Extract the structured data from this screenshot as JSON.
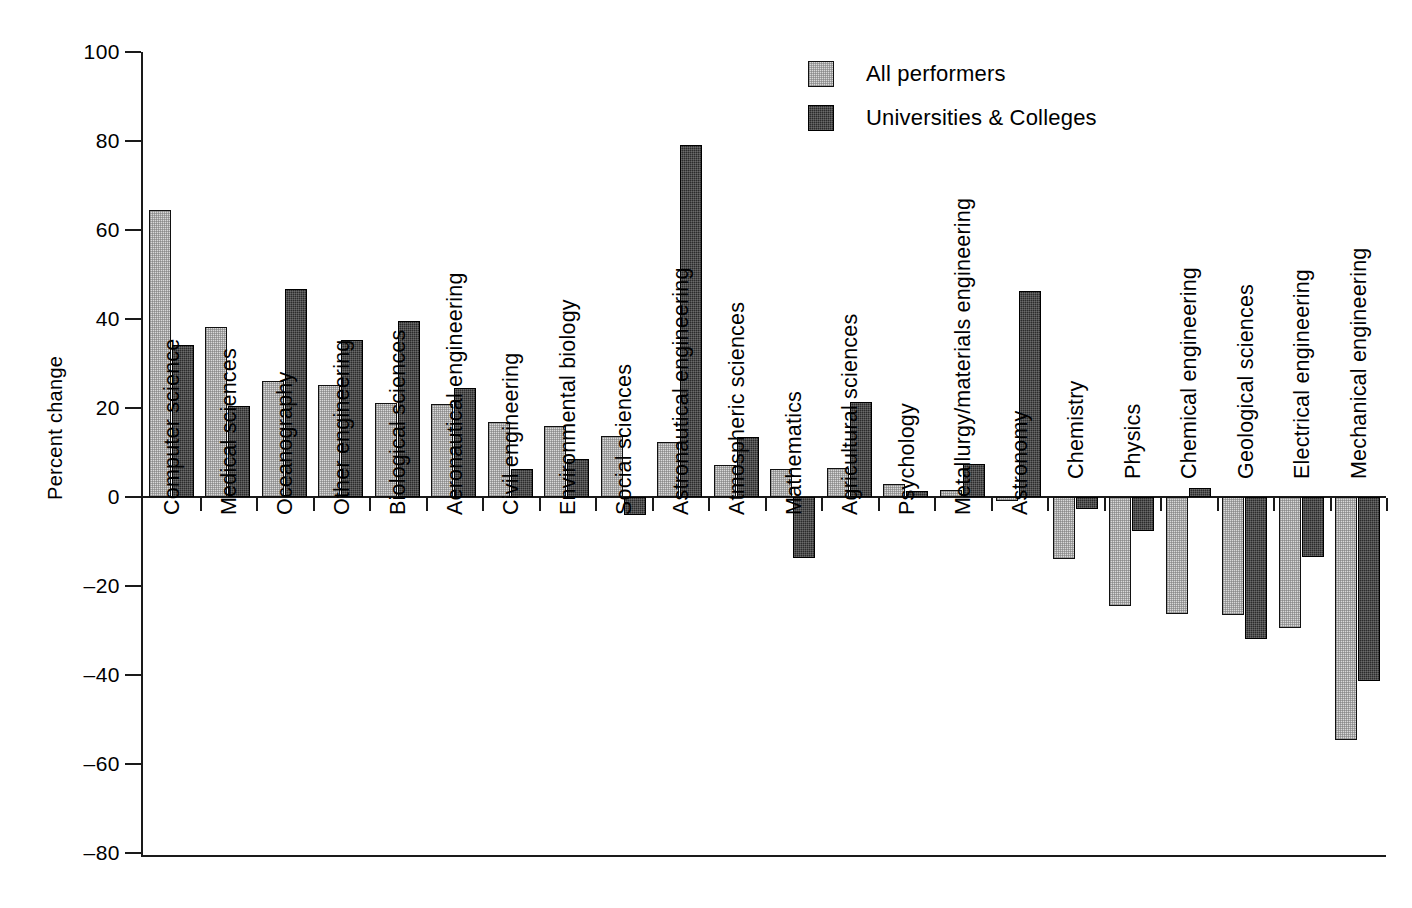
{
  "chart_data": {
    "type": "bar",
    "title": "",
    "xlabel": "",
    "ylabel": "Percent change",
    "ylim": [
      -80,
      100
    ],
    "yticks": [
      100,
      80,
      60,
      40,
      20,
      0,
      -20,
      -40,
      -60,
      -80
    ],
    "ytick_labels": [
      "100",
      "80",
      "60",
      "40",
      "20",
      "0",
      "–20",
      "–40",
      "–60",
      "–80"
    ],
    "grid": false,
    "legend_position": "top-right",
    "categories": [
      "Computer science",
      "Medical sciences",
      "Oceanography",
      "Other engineering",
      "Biological sciences",
      "Aeronautical engineering",
      "Civil  engineering",
      "Environmental biology",
      "Social sciences",
      "Astronautical engineering",
      "Atmospheric sciences",
      "Mathematics",
      "Agricultural sciences",
      "Psychology",
      "Metallurgy/materials engineering",
      "Astronomy",
      "Chemistry",
      "Physics",
      "Chemical engineering",
      "Geological sciences",
      "Electrical engineering",
      "Mechanical engineering"
    ],
    "series": [
      {
        "name": "All performers",
        "color": "#d9d9d9",
        "values": [
          64.5,
          38.3,
          26.0,
          25.2,
          21.2,
          20.8,
          16.8,
          16.0,
          13.6,
          12.4,
          7.1,
          6.2,
          6.5,
          3.0,
          1.6,
          -1.0,
          -14.0,
          -24.6,
          -26.2,
          -26.6,
          -29.4,
          -54.6
        ]
      },
      {
        "name": "Universities & Colleges",
        "color": "#2b2b2b",
        "values": [
          34.2,
          20.4,
          46.7,
          35.2,
          39.5,
          24.4,
          6.2,
          8.5,
          -4.0,
          79.2,
          13.5,
          -13.8,
          21.3,
          1.3,
          7.4,
          46.4,
          -2.6,
          -7.6,
          2.0,
          -32.0,
          -13.4,
          -41.4
        ]
      }
    ]
  },
  "axis": {
    "y_title": "Percent change"
  },
  "legend": {
    "items": [
      {
        "label": "All performers",
        "swatch": "light-hatched-square"
      },
      {
        "label": "Universities & Colleges",
        "swatch": "dark-hatched-square"
      }
    ]
  }
}
